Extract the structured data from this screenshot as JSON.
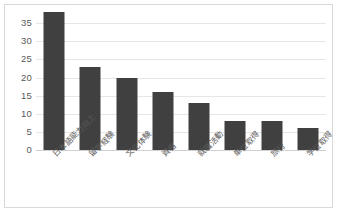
{
  "chart_data": {
    "type": "bar",
    "title": "",
    "subtitle": "",
    "xlabel": "",
    "ylabel": "",
    "categories": [
      "日本語能力向上",
      "留学経験",
      "文化体験",
      "資格",
      "就職活動",
      "単位取得",
      "旅行",
      "学位取得"
    ],
    "values": [
      38,
      23,
      20,
      16,
      13,
      8,
      8,
      6
    ],
    "ylim": [
      0,
      40
    ],
    "ytick_labels": [
      "0",
      "5",
      "10",
      "15",
      "20",
      "25",
      "30",
      "35"
    ],
    "ytick_values": [
      0,
      5,
      10,
      15,
      20,
      25,
      30,
      35
    ],
    "grid": true,
    "legend": false,
    "legend_position": "none",
    "series": [
      {
        "name": "",
        "values": [
          38,
          23,
          20,
          16,
          13,
          8,
          8,
          6
        ]
      }
    ]
  },
  "style": {
    "bar_color": "#404040",
    "grid_color": "#e6e6e6",
    "axis_text_color": "#595959",
    "border_color": "#d9d9d9",
    "background": "#ffffff"
  }
}
